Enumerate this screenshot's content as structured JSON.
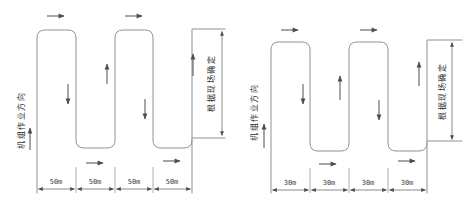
{
  "diagrams": [
    {
      "name": "serpentine-pattern-50m",
      "working_direction_label": "机组作业方向",
      "headland_note": "根据现场确定",
      "swath_labels": [
        "50m",
        "50m",
        "50m",
        "50m"
      ]
    },
    {
      "name": "serpentine-pattern-30m",
      "working_direction_label": "机组作业方向",
      "headland_note": "根据现场确定",
      "swath_labels": [
        "30m",
        "30m",
        "30m",
        "30m"
      ]
    }
  ]
}
